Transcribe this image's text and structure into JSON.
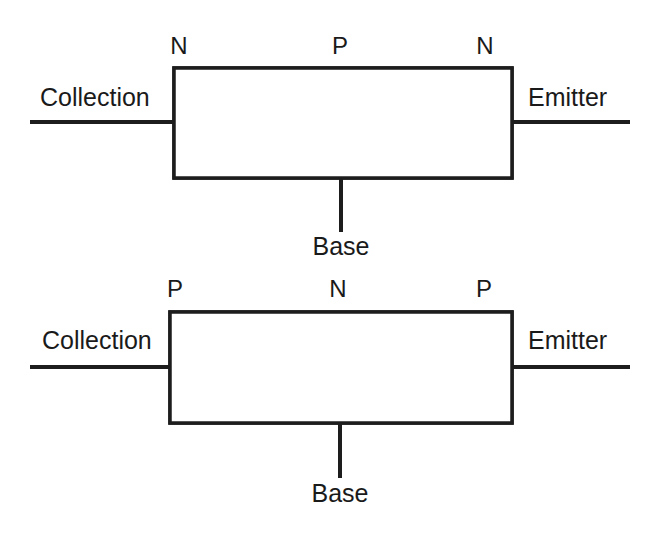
{
  "page": {
    "background_color": "#ffffff",
    "ink_color": "#1d1d1d"
  },
  "diagrams": [
    {
      "id": "npn",
      "type": "NPN transistor",
      "zone_labels": [
        "N",
        "P",
        "N"
      ],
      "left_lead_label": "Collection",
      "right_lead_label": "Emitter",
      "base_lead_label": "Base",
      "regions": [
        {
          "label": "N",
          "hatched": true
        },
        {
          "label": "P",
          "hatched": false
        },
        {
          "label": "N",
          "hatched": true
        }
      ]
    },
    {
      "id": "pnp",
      "type": "PNP transistor",
      "zone_labels": [
        "P",
        "N",
        "P"
      ],
      "left_lead_label": "Collection",
      "right_lead_label": "Emitter",
      "base_lead_label": "Base",
      "regions": [
        {
          "label": "P",
          "hatched": false
        },
        {
          "label": "N",
          "hatched": true
        },
        {
          "label": "P",
          "hatched": false
        }
      ]
    }
  ]
}
